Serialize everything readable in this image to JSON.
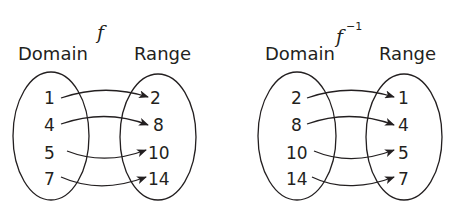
{
  "diagrams": [
    {
      "function_label": "f",
      "superscript": "",
      "domain_label": "Domain",
      "range_label": "Range",
      "domain": [
        "1",
        "4",
        "5",
        "7"
      ],
      "range": [
        "2",
        "8",
        "10",
        "14"
      ],
      "mappings": [
        [
          "1",
          "2"
        ],
        [
          "4",
          "8"
        ],
        [
          "5",
          "10"
        ],
        [
          "7",
          "14"
        ]
      ]
    },
    {
      "function_label": "f",
      "superscript": "−1",
      "domain_label": "Domain",
      "range_label": "Range",
      "domain": [
        "2",
        "8",
        "10",
        "14"
      ],
      "range": [
        "1",
        "4",
        "5",
        "7"
      ],
      "mappings": [
        [
          "2",
          "1"
        ],
        [
          "8",
          "4"
        ],
        [
          "10",
          "5"
        ],
        [
          "14",
          "7"
        ]
      ]
    }
  ],
  "colors": {
    "ink": "#231f20",
    "background": "#ffffff"
  }
}
